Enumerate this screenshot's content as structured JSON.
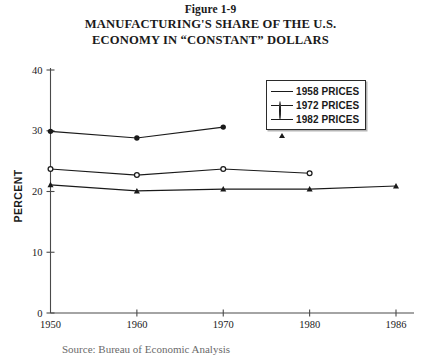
{
  "figure": {
    "label": "Figure 1-9",
    "title_line_1": "MANUFACTURING'S SHARE OF THE U.S.",
    "title_line_2": "ECONOMY IN “CONSTANT” DOLLARS"
  },
  "axes": {
    "y_title": "PERCENT",
    "y_ticks": [
      "0",
      "10",
      "20",
      "30",
      "40"
    ],
    "x_ticks": [
      "1950",
      "1960",
      "1970",
      "1980",
      "1986"
    ]
  },
  "legend": {
    "entries": [
      {
        "label": "1958 PRICES",
        "marker": "filled-circle-marker"
      },
      {
        "label": "1972 PRICES",
        "marker": "open-circle-marker"
      },
      {
        "label": "1982 PRICES",
        "marker": "filled-triangle-marker"
      }
    ]
  },
  "caption": {
    "source_text": "Source: Bureau of Economic Analysis"
  },
  "colors": {
    "line": "#1a1a1a",
    "axis": "#4a4a4a",
    "background": "#ffffff"
  },
  "chart_data": {
    "type": "line",
    "title": "MANUFACTURING'S SHARE OF THE U.S. ECONOMY IN “CONSTANT” DOLLARS",
    "subtitle": "Figure 1-9",
    "xlabel": "",
    "ylabel": "PERCENT",
    "x": [
      "1950",
      "1960",
      "1970",
      "1980",
      "1986"
    ],
    "xlim": [
      "1950",
      "1986"
    ],
    "ylim": [
      0,
      40
    ],
    "yticks": [
      0,
      10,
      20,
      30,
      40
    ],
    "grid": false,
    "legend_position": "upper-right",
    "series": [
      {
        "name": "1958 PRICES",
        "marker": "filled-circle",
        "x": [
          "1950",
          "1960",
          "1970"
        ],
        "values": [
          29.9,
          28.8,
          30.6
        ]
      },
      {
        "name": "1972 PRICES",
        "marker": "open-circle",
        "x": [
          "1950",
          "1960",
          "1970",
          "1980"
        ],
        "values": [
          23.7,
          22.7,
          23.7,
          23.0
        ]
      },
      {
        "name": "1982 PRICES",
        "marker": "filled-triangle",
        "x": [
          "1950",
          "1960",
          "1970",
          "1980",
          "1986"
        ],
        "values": [
          21.1,
          20.1,
          20.4,
          20.4,
          20.9
        ]
      }
    ]
  }
}
